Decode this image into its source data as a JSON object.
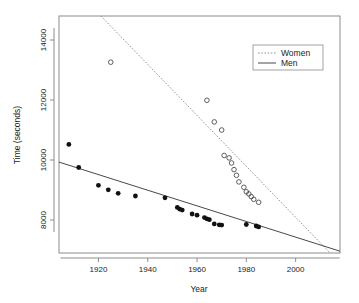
{
  "chart_data": {
    "type": "scatter",
    "title": "",
    "xlabel": "Year",
    "ylabel": "Time (seconds)",
    "xlim": [
      1904,
      2018
    ],
    "ylim": [
      6900,
      14800
    ],
    "xticks": [
      1920,
      1940,
      1960,
      1980,
      2000
    ],
    "yticks": [
      8000,
      10000,
      12000,
      14000
    ],
    "grid": false,
    "legend_position": "top-right",
    "series": [
      {
        "name": "Women",
        "marker": "open-circle",
        "line_style": "dotted",
        "points": [
          {
            "x": 1925,
            "y": 13260
          },
          {
            "x": 1964,
            "y": 11990
          },
          {
            "x": 1967,
            "y": 11270
          },
          {
            "x": 1970,
            "y": 11000
          },
          {
            "x": 1971,
            "y": 10150
          },
          {
            "x": 1973,
            "y": 10070
          },
          {
            "x": 1974,
            "y": 9900
          },
          {
            "x": 1975,
            "y": 9680
          },
          {
            "x": 1976,
            "y": 9490
          },
          {
            "x": 1977,
            "y": 9270
          },
          {
            "x": 1979,
            "y": 9090
          },
          {
            "x": 1980,
            "y": 8940
          },
          {
            "x": 1981,
            "y": 8870
          },
          {
            "x": 1982,
            "y": 8780
          },
          {
            "x": 1983,
            "y": 8690
          },
          {
            "x": 1985,
            "y": 8590
          }
        ],
        "fit_line": {
          "x1": 1921,
          "y1": 14800,
          "x2": 2014,
          "y2": 6900
        }
      },
      {
        "name": "Men",
        "marker": "filled-circle",
        "line_style": "solid",
        "points": [
          {
            "x": 1908,
            "y": 10520
          },
          {
            "x": 1912,
            "y": 9750
          },
          {
            "x": 1920,
            "y": 9155
          },
          {
            "x": 1924,
            "y": 9005
          },
          {
            "x": 1928,
            "y": 8890
          },
          {
            "x": 1935,
            "y": 8800
          },
          {
            "x": 1947,
            "y": 8740
          },
          {
            "x": 1952,
            "y": 8420
          },
          {
            "x": 1953,
            "y": 8360
          },
          {
            "x": 1954,
            "y": 8330
          },
          {
            "x": 1958,
            "y": 8200
          },
          {
            "x": 1960,
            "y": 8160
          },
          {
            "x": 1963,
            "y": 8080
          },
          {
            "x": 1964,
            "y": 8040
          },
          {
            "x": 1965,
            "y": 8010
          },
          {
            "x": 1967,
            "y": 7870
          },
          {
            "x": 1969,
            "y": 7840
          },
          {
            "x": 1970,
            "y": 7830
          },
          {
            "x": 1980,
            "y": 7850
          },
          {
            "x": 1984,
            "y": 7800
          },
          {
            "x": 1985,
            "y": 7770
          }
        ],
        "fit_line": {
          "x1": 1904,
          "y1": 9930,
          "x2": 2018,
          "y2": 6960
        }
      }
    ]
  },
  "legend": {
    "items": [
      {
        "label": "Women",
        "style": "dotted"
      },
      {
        "label": "Men",
        "style": "solid"
      }
    ]
  },
  "axis": {
    "x_title": "Year",
    "y_title": "Time (seconds)",
    "x_tick_labels": [
      "1920",
      "1940",
      "1960",
      "1980",
      "2000"
    ],
    "y_tick_labels": [
      "8000",
      "10000",
      "12000",
      "14000"
    ]
  },
  "colors": {
    "men_marker": "#111111",
    "women_marker": "#4d4d4d",
    "men_line": "#333333",
    "women_line": "#888888",
    "frame": "#8c8c8c",
    "background": "#ffffff"
  }
}
